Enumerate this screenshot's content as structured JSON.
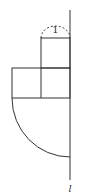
{
  "diagram": {
    "type": "geometry-figure",
    "labels": {
      "arc_label": "1",
      "axis_label": "l"
    },
    "colors": {
      "stroke": "#333333",
      "background": "#ffffff"
    },
    "shapes": [
      {
        "name": "top-square",
        "side": 1
      },
      {
        "name": "middle-rectangle-left-square",
        "side": 1
      },
      {
        "name": "middle-rectangle-right-square",
        "side": 1
      },
      {
        "name": "quarter-circle",
        "radius": 2
      },
      {
        "name": "dashed-semicircle-arc",
        "diameter": 1
      }
    ]
  }
}
